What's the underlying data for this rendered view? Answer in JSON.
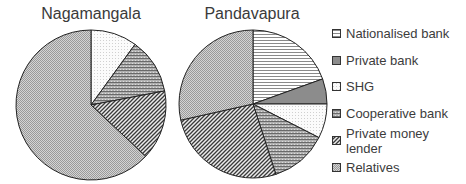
{
  "chart_data": [
    {
      "type": "pie",
      "title": "Nagamangala",
      "categories": [
        "Nationalised bank",
        "Private bank",
        "SHG",
        "Cooperative bank",
        "Private money lender",
        "Relatives"
      ],
      "values": [
        0,
        0,
        10,
        12,
        15,
        63
      ],
      "unit": "%",
      "start_angle": "12 o'clock, clockwise"
    },
    {
      "type": "pie",
      "title": "Pandavapura",
      "categories": [
        "Nationalised bank",
        "Private bank",
        "SHG",
        "Cooperative bank",
        "Private money lender",
        "Relatives"
      ],
      "values": [
        19.5,
        5.5,
        7.5,
        12.5,
        26.5,
        28.5
      ],
      "unit": "%",
      "start_angle": "12 o'clock, clockwise"
    }
  ],
  "titles": {
    "left": "Nagamangala",
    "right": "Pandavapura"
  },
  "legend": {
    "position": "right",
    "items": [
      {
        "label": "Nationalised bank",
        "pattern": "hlines"
      },
      {
        "label": "Private bank",
        "pattern": "solid-gray"
      },
      {
        "label": "SHG",
        "pattern": "light-dots"
      },
      {
        "label": "Cooperative bank",
        "pattern": "dense-hlines"
      },
      {
        "label": "Private money lender",
        "pattern": "diagonal"
      },
      {
        "label": "Relatives",
        "pattern": "checker"
      }
    ]
  },
  "pies": {
    "left": {
      "cx": 91,
      "cy": 105,
      "r": 75
    },
    "right": {
      "cx": 253,
      "cy": 104,
      "r": 74
    }
  }
}
